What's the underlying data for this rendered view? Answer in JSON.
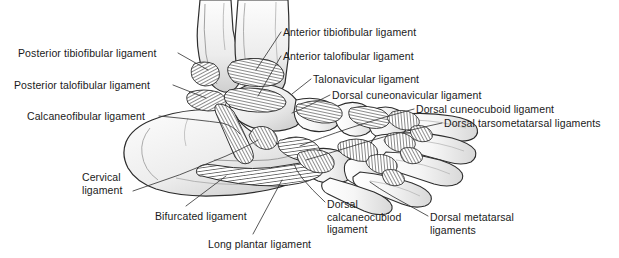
{
  "figure": {
    "background_color": "#ffffff",
    "text_color": "#1a1a1a",
    "line_color": "#3a3a3a",
    "width": 619,
    "height": 258
  },
  "labels": [
    {
      "id": "posterior-tibiofibular",
      "text": "Posterior tibiofibular ligament",
      "lines": [
        "Posterior tibiofibular ligament"
      ],
      "x": 18,
      "y": 47,
      "align": "left"
    },
    {
      "id": "posterior-talofibular",
      "text": "Posterior talofibular ligament",
      "lines": [
        "Posterior talofibular ligament"
      ],
      "x": 14,
      "y": 79,
      "align": "left"
    },
    {
      "id": "calcaneofibular",
      "text": "Calcaneofibular ligament",
      "lines": [
        "Calcaneofibular ligament"
      ],
      "x": 27,
      "y": 110,
      "align": "left"
    },
    {
      "id": "anterior-tibiofibular",
      "text": "Anterior tibiofibular ligament",
      "lines": [
        "Anterior tibiofibular ligament"
      ],
      "x": 283,
      "y": 26,
      "align": "left"
    },
    {
      "id": "anterior-talofibular",
      "text": "Anterior talofibular ligament",
      "lines": [
        "Anterior talofibular ligament"
      ],
      "x": 283,
      "y": 50,
      "align": "left"
    },
    {
      "id": "talonavicular",
      "text": "Talonavicular ligament",
      "lines": [
        "Talonavicular ligament"
      ],
      "x": 313,
      "y": 73,
      "align": "left"
    },
    {
      "id": "dorsal-cuneonavicular",
      "text": "Dorsal cuneonavicular ligament",
      "lines": [
        "Dorsal cuneonavicular ligament"
      ],
      "x": 332,
      "y": 89,
      "align": "left"
    },
    {
      "id": "dorsal-cuneocuboid",
      "text": "Dorsal cuneocuboid ligament",
      "lines": [
        "Dorsal cuneocuboid ligament"
      ],
      "x": 416,
      "y": 103,
      "align": "left"
    },
    {
      "id": "dorsal-tarsometatarsal",
      "text": "Dorsal tarsometatarsal ligaments",
      "lines": [
        "Dorsal tarsometatarsal ligaments"
      ],
      "x": 444,
      "y": 117,
      "align": "left"
    },
    {
      "id": "cervical",
      "text": "Cervical ligament",
      "lines": [
        "Cervical",
        "ligament"
      ],
      "x": 82,
      "y": 171,
      "align": "left"
    },
    {
      "id": "bifurcated",
      "text": "Bifurcated ligament",
      "lines": [
        "Bifurcated ligament"
      ],
      "x": 155,
      "y": 210,
      "align": "left"
    },
    {
      "id": "long-plantar",
      "text": "Long plantar ligament",
      "lines": [
        "Long plantar ligament"
      ],
      "x": 208,
      "y": 238,
      "align": "left"
    },
    {
      "id": "dorsal-calcaneocuboid",
      "text": "Dorsal calcaneocubiod ligament",
      "lines": [
        "Dorsal",
        "calcaneocubiod",
        "ligament"
      ],
      "x": 327,
      "y": 198,
      "align": "left"
    },
    {
      "id": "dorsal-metatarsal",
      "text": "Dorsal metatarsal ligaments",
      "lines": [
        "Dorsal metatarsal",
        "ligaments"
      ],
      "x": 430,
      "y": 211,
      "align": "left"
    }
  ],
  "anatomy": {
    "bones": [
      "fibula",
      "tibia",
      "talus",
      "calcaneus",
      "navicular",
      "cuboid",
      "cuneiforms",
      "metatarsals"
    ]
  }
}
